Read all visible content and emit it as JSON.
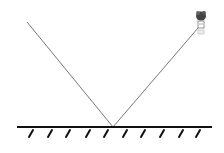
{
  "diagram": {
    "title": "",
    "colors": {
      "ray": "#777777",
      "mirror": "#111111",
      "observer": "#333333",
      "background": "#ffffff"
    },
    "incident_ray": {
      "from": [
        27,
        22
      ],
      "to": [
        113,
        127
      ]
    },
    "reflected_ray": {
      "from": [
        113,
        127
      ],
      "to": [
        198,
        28
      ]
    },
    "mirror": {
      "x1": 17,
      "x2": 212,
      "y": 127,
      "hatch_count": 10
    },
    "observer": {
      "label": "",
      "icon": "person-head-icon"
    }
  }
}
